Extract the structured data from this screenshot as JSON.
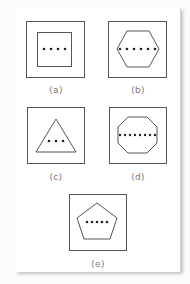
{
  "figure": {
    "panels": [
      {
        "id": "a",
        "label": "(a)",
        "shape": "square",
        "sides": 4,
        "dots": 4
      },
      {
        "id": "b",
        "label": "(b)",
        "shape": "hexagon",
        "sides": 6,
        "dots": 6
      },
      {
        "id": "c",
        "label": "(c)",
        "shape": "triangle",
        "sides": 3,
        "dots": 3
      },
      {
        "id": "d",
        "label": "(d)",
        "shape": "octagon",
        "sides": 8,
        "dots": 8
      },
      {
        "id": "e",
        "label": "(e)",
        "shape": "pentagon",
        "sides": 5,
        "dots": 5
      }
    ],
    "colors": {
      "stroke": "#555555",
      "dot": "#222222",
      "label": "#7a7a7a",
      "background": "#ffffff"
    }
  }
}
